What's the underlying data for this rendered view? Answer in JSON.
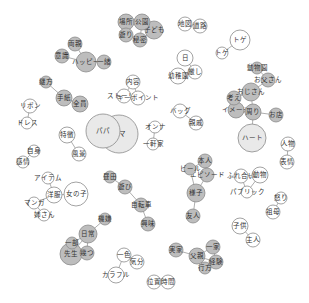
{
  "diagram": {
    "type": "co-occurrence-network",
    "colors": {
      "filled": "#bdbdbd",
      "light": "#e9e9e9",
      "empty": "#ffffff",
      "stroke": "#8a8a8a",
      "text": "#333333"
    },
    "nodes": [
      {
        "id": "n1",
        "label": "場所",
        "style": "filled",
        "x": 126,
        "y": 22,
        "r": 8
      },
      {
        "id": "n2",
        "label": "公園",
        "style": "filled",
        "x": 142,
        "y": 22,
        "r": 8
      },
      {
        "id": "n3",
        "label": "子ども",
        "style": "filled",
        "x": 154,
        "y": 30,
        "r": 9
      },
      {
        "id": "n4",
        "label": "遊り",
        "style": "filled",
        "x": 126,
        "y": 35,
        "r": 7
      },
      {
        "id": "n5",
        "label": "秘密",
        "style": "filled",
        "x": 140,
        "y": 40,
        "r": 7
      },
      {
        "id": "n6",
        "label": "地図",
        "style": "empty",
        "x": 185,
        "y": 24,
        "r": 7
      },
      {
        "id": "n7",
        "label": "道路",
        "style": "empty",
        "x": 200,
        "y": 26,
        "r": 7
      },
      {
        "id": "n8",
        "label": "両親",
        "style": "filled",
        "x": 75,
        "y": 44,
        "r": 7
      },
      {
        "id": "n9",
        "label": "意識",
        "style": "filled",
        "x": 62,
        "y": 56,
        "r": 7
      },
      {
        "id": "n10",
        "label": "ハッピー",
        "style": "filled",
        "x": 86,
        "y": 62,
        "r": 10
      },
      {
        "id": "n11",
        "label": "一緒",
        "style": "filled",
        "x": 104,
        "y": 62,
        "r": 7
      },
      {
        "id": "n12",
        "label": "トゲ",
        "style": "empty",
        "x": 240,
        "y": 40,
        "r": 10
      },
      {
        "id": "n13",
        "label": "トゲ",
        "style": "empty",
        "x": 222,
        "y": 53,
        "r": 6
      },
      {
        "id": "n14",
        "label": "日",
        "style": "empty",
        "x": 185,
        "y": 58,
        "r": 8
      },
      {
        "id": "n15",
        "label": "厳し",
        "style": "empty",
        "x": 195,
        "y": 72,
        "r": 7
      },
      {
        "id": "n16",
        "label": "幼稚園",
        "style": "empty",
        "x": 178,
        "y": 76,
        "r": 8
      },
      {
        "id": "n17",
        "label": "継方",
        "style": "filled",
        "x": 46,
        "y": 82,
        "r": 6
      },
      {
        "id": "n18",
        "label": "手紙",
        "style": "filled",
        "x": 64,
        "y": 98,
        "r": 8
      },
      {
        "id": "n19",
        "label": "全員",
        "style": "filled",
        "x": 80,
        "y": 104,
        "r": 8
      },
      {
        "id": "n20",
        "label": "内容",
        "style": "empty",
        "x": 133,
        "y": 82,
        "r": 7
      },
      {
        "id": "n21",
        "label": "ストーリー",
        "style": "empty",
        "x": 124,
        "y": 96,
        "r": 7
      },
      {
        "id": "n22",
        "label": "キーポイント",
        "style": "empty",
        "x": 138,
        "y": 98,
        "r": 7
      },
      {
        "id": "n23",
        "label": "動物園",
        "style": "filled",
        "x": 257,
        "y": 68,
        "r": 6
      },
      {
        "id": "n24",
        "label": "お父さん",
        "style": "filled",
        "x": 268,
        "y": 80,
        "r": 7
      },
      {
        "id": "n25",
        "label": "おじさん",
        "style": "filled",
        "x": 251,
        "y": 92,
        "r": 9
      },
      {
        "id": "n26",
        "label": "考え",
        "style": "filled",
        "x": 234,
        "y": 98,
        "r": 7
      },
      {
        "id": "n27",
        "label": "イメージ",
        "style": "filled",
        "x": 236,
        "y": 110,
        "r": 8
      },
      {
        "id": "n28",
        "label": "周り",
        "style": "filled",
        "x": 253,
        "y": 112,
        "r": 8
      },
      {
        "id": "n29",
        "label": "お店",
        "style": "filled",
        "x": 276,
        "y": 115,
        "r": 7
      },
      {
        "id": "n30",
        "label": "ハート",
        "style": "light",
        "x": 252,
        "y": 138,
        "r": 14
      },
      {
        "id": "n31",
        "label": "リボン",
        "style": "empty",
        "x": 30,
        "y": 106,
        "r": 7
      },
      {
        "id": "n32",
        "label": "ドレス",
        "style": "empty",
        "x": 27,
        "y": 123,
        "r": 6
      },
      {
        "id": "n33",
        "label": "バッグ",
        "style": "empty",
        "x": 180,
        "y": 111,
        "r": 7
      },
      {
        "id": "n34",
        "label": "親戚",
        "style": "empty",
        "x": 196,
        "y": 123,
        "r": 7
      },
      {
        "id": "n35",
        "label": "パパ",
        "style": "light",
        "x": 103,
        "y": 131,
        "r": 17
      },
      {
        "id": "n36",
        "label": "ママ",
        "style": "light",
        "x": 119,
        "y": 134,
        "r": 19
      },
      {
        "id": "n37",
        "label": "特徴",
        "style": "empty",
        "x": 67,
        "y": 135,
        "r": 8
      },
      {
        "id": "n38",
        "label": "風景",
        "style": "empty",
        "x": 79,
        "y": 154,
        "r": 7
      },
      {
        "id": "n39",
        "label": "オンナ",
        "style": "empty",
        "x": 155,
        "y": 127,
        "r": 6
      },
      {
        "id": "n40",
        "label": "一軒家",
        "style": "empty",
        "x": 153,
        "y": 144,
        "r": 6
      },
      {
        "id": "n41",
        "label": "人物",
        "style": "empty",
        "x": 288,
        "y": 144,
        "r": 7
      },
      {
        "id": "n42",
        "label": "表情",
        "style": "empty",
        "x": 287,
        "y": 162,
        "r": 7
      },
      {
        "id": "n43",
        "label": "自身",
        "style": "empty",
        "x": 34,
        "y": 151,
        "r": 6
      },
      {
        "id": "n44",
        "label": "感情",
        "style": "empty",
        "x": 23,
        "y": 162,
        "r": 6
      },
      {
        "id": "n45",
        "label": "本人",
        "style": "filled",
        "x": 205,
        "y": 161,
        "r": 7
      },
      {
        "id": "n46",
        "label": "ビール",
        "style": "filled",
        "x": 190,
        "y": 169,
        "r": 6
      },
      {
        "id": "n47",
        "label": "エピソード",
        "style": "filled",
        "x": 207,
        "y": 175,
        "r": 7
      },
      {
        "id": "n48",
        "label": "様子",
        "style": "filled",
        "x": 196,
        "y": 193,
        "r": 9
      },
      {
        "id": "n49",
        "label": "友人",
        "style": "filled",
        "x": 193,
        "y": 216,
        "r": 7
      },
      {
        "id": "n50",
        "label": "ふれ合い",
        "style": "empty",
        "x": 241,
        "y": 176,
        "r": 7
      },
      {
        "id": "n51",
        "label": "動物",
        "style": "empty",
        "x": 260,
        "y": 175,
        "r": 8
      },
      {
        "id": "n52",
        "label": "パブリック",
        "style": "empty",
        "x": 247,
        "y": 192,
        "r": 6
      },
      {
        "id": "n53",
        "label": "怒り",
        "style": "empty",
        "x": 281,
        "y": 198,
        "r": 6
      },
      {
        "id": "n54",
        "label": "祖母",
        "style": "empty",
        "x": 273,
        "y": 212,
        "r": 7
      },
      {
        "id": "n55",
        "label": "アイテム",
        "style": "empty",
        "x": 48,
        "y": 178,
        "r": 6
      },
      {
        "id": "n56",
        "label": "洋服",
        "style": "empty",
        "x": 54,
        "y": 195,
        "r": 8
      },
      {
        "id": "n57",
        "label": "女の子",
        "style": "empty",
        "x": 76,
        "y": 194,
        "r": 12
      },
      {
        "id": "n58",
        "label": "マンガ",
        "style": "empty",
        "x": 34,
        "y": 203,
        "r": 6
      },
      {
        "id": "n59",
        "label": "姉さん",
        "style": "empty",
        "x": 44,
        "y": 215,
        "r": 6
      },
      {
        "id": "n60",
        "label": "昼田",
        "style": "filled",
        "x": 110,
        "y": 177,
        "r": 6
      },
      {
        "id": "n61",
        "label": "遊び",
        "style": "filled",
        "x": 125,
        "y": 187,
        "r": 7
      },
      {
        "id": "n62",
        "label": "自転車",
        "style": "filled",
        "x": 141,
        "y": 205,
        "r": 7
      },
      {
        "id": "n63",
        "label": "興味",
        "style": "filled",
        "x": 148,
        "y": 224,
        "r": 7
      },
      {
        "id": "n64",
        "label": "子供",
        "style": "empty",
        "x": 240,
        "y": 226,
        "r": 8
      },
      {
        "id": "n65",
        "label": "主人",
        "style": "empty",
        "x": 253,
        "y": 240,
        "r": 7
      },
      {
        "id": "n66",
        "label": "機嫌",
        "style": "filled",
        "x": 105,
        "y": 219,
        "r": 6
      },
      {
        "id": "n67",
        "label": "日常",
        "style": "filled",
        "x": 88,
        "y": 234,
        "r": 9
      },
      {
        "id": "n68",
        "label": "一部",
        "style": "filled",
        "x": 72,
        "y": 243,
        "r": 6
      },
      {
        "id": "n69",
        "label": "先生",
        "style": "filled",
        "x": 71,
        "y": 254,
        "r": 11
      },
      {
        "id": "n70",
        "label": "幾つ",
        "style": "filled",
        "x": 87,
        "y": 253,
        "r": 7
      },
      {
        "id": "n71",
        "label": "実家",
        "style": "filled",
        "x": 176,
        "y": 250,
        "r": 7
      },
      {
        "id": "n72",
        "label": "一家",
        "style": "filled",
        "x": 213,
        "y": 247,
        "r": 7
      },
      {
        "id": "n73",
        "label": "父親",
        "style": "filled",
        "x": 197,
        "y": 256,
        "r": 8
      },
      {
        "id": "n74",
        "label": "経験",
        "style": "filled",
        "x": 216,
        "y": 262,
        "r": 7
      },
      {
        "id": "n75",
        "label": "行方",
        "style": "filled",
        "x": 205,
        "y": 268,
        "r": 6
      },
      {
        "id": "n76",
        "label": "一色",
        "style": "empty",
        "x": 124,
        "y": 255,
        "r": 7
      },
      {
        "id": "n77",
        "label": "気分",
        "style": "empty",
        "x": 137,
        "y": 262,
        "r": 7
      },
      {
        "id": "n78",
        "label": "カラフル",
        "style": "empty",
        "x": 116,
        "y": 275,
        "r": 8
      },
      {
        "id": "n79",
        "label": "位置",
        "style": "empty",
        "x": 154,
        "y": 282,
        "r": 7
      },
      {
        "id": "n80",
        "label": "時間",
        "style": "empty",
        "x": 168,
        "y": 282,
        "r": 7
      }
    ],
    "edges": [
      [
        "n1",
        "n2"
      ],
      [
        "n1",
        "n4"
      ],
      [
        "n2",
        "n3"
      ],
      [
        "n4",
        "n5"
      ],
      [
        "n2",
        "n5"
      ],
      [
        "n3",
        "n5"
      ],
      [
        "n6",
        "n7"
      ],
      [
        "n8",
        "n10"
      ],
      [
        "n9",
        "n10"
      ],
      [
        "n10",
        "n11"
      ],
      [
        "n12",
        "n13"
      ],
      [
        "n14",
        "n15"
      ],
      [
        "n15",
        "n16"
      ],
      [
        "n17",
        "n18"
      ],
      [
        "n18",
        "n19"
      ],
      [
        "n20",
        "n21"
      ],
      [
        "n20",
        "n22"
      ],
      [
        "n21",
        "n22"
      ],
      [
        "n23",
        "n24"
      ],
      [
        "n24",
        "n25"
      ],
      [
        "n25",
        "n26"
      ],
      [
        "n25",
        "n28"
      ],
      [
        "n26",
        "n27"
      ],
      [
        "n27",
        "n28"
      ],
      [
        "n28",
        "n29"
      ],
      [
        "n28",
        "n30"
      ],
      [
        "n31",
        "n32"
      ],
      [
        "n33",
        "n34"
      ],
      [
        "n35",
        "n36"
      ],
      [
        "n37",
        "n38"
      ],
      [
        "n39",
        "n40"
      ],
      [
        "n41",
        "n42"
      ],
      [
        "n43",
        "n44"
      ],
      [
        "n45",
        "n46"
      ],
      [
        "n45",
        "n47"
      ],
      [
        "n46",
        "n48"
      ],
      [
        "n47",
        "n48"
      ],
      [
        "n48",
        "n49"
      ],
      [
        "n50",
        "n51"
      ],
      [
        "n51",
        "n52"
      ],
      [
        "n50",
        "n52"
      ],
      [
        "n53",
        "n54"
      ],
      [
        "n55",
        "n56"
      ],
      [
        "n56",
        "n57"
      ],
      [
        "n56",
        "n58"
      ],
      [
        "n58",
        "n59"
      ],
      [
        "n60",
        "n61"
      ],
      [
        "n61",
        "n62"
      ],
      [
        "n62",
        "n63"
      ],
      [
        "n64",
        "n65"
      ],
      [
        "n66",
        "n67"
      ],
      [
        "n67",
        "n68"
      ],
      [
        "n67",
        "n69"
      ],
      [
        "n68",
        "n69"
      ],
      [
        "n69",
        "n70"
      ],
      [
        "n67",
        "n70"
      ],
      [
        "n71",
        "n73"
      ],
      [
        "n72",
        "n73"
      ],
      [
        "n73",
        "n74"
      ],
      [
        "n73",
        "n75"
      ],
      [
        "n72",
        "n74"
      ],
      [
        "n74",
        "n75"
      ],
      [
        "n76",
        "n77"
      ],
      [
        "n76",
        "n78"
      ],
      [
        "n79",
        "n80"
      ]
    ]
  }
}
